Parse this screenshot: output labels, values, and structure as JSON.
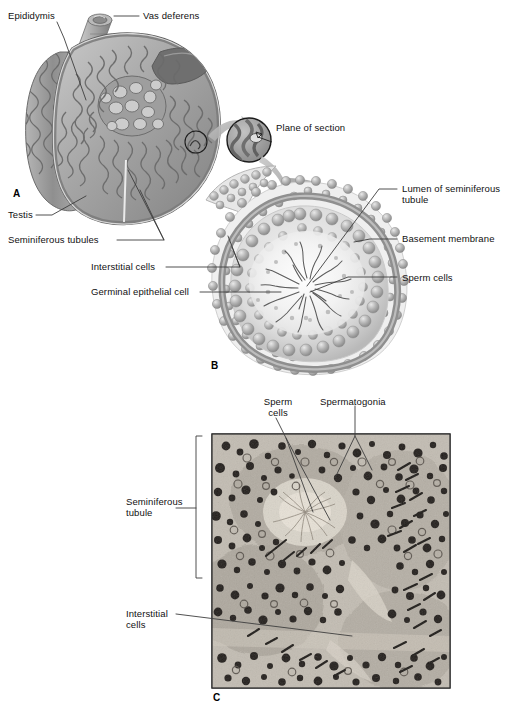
{
  "figure": {
    "type": "anatomy-illustration-plate",
    "panels": [
      "A",
      "B",
      "C"
    ]
  },
  "panel_a": {
    "letter": "A",
    "caption_type": "sagittal-section-illustration-of-testis-and-epididymis",
    "labels": [
      {
        "id": "epididymis",
        "text": "Epididymis"
      },
      {
        "id": "vas-deferens",
        "text": "Vas deferens"
      },
      {
        "id": "testis",
        "text": "Testis"
      },
      {
        "id": "seminiferous-tubules",
        "text": "Seminiferous tubules"
      }
    ]
  },
  "panel_inset": {
    "label": "Plane of section"
  },
  "panel_b": {
    "letter": "B",
    "caption_type": "cross-section-illustration-of-seminiferous-tubule",
    "labels": [
      {
        "id": "lumen-of-seminiferous-tubule",
        "text": "Lumen of seminiferous\ntubule",
        "line1": "Lumen of seminiferous",
        "line2": "tubule"
      },
      {
        "id": "basement-membrane",
        "text": "Basement membrane"
      },
      {
        "id": "sperm-cells",
        "text": "Sperm cells"
      },
      {
        "id": "interstitial-cells",
        "text": "Interstitial cells"
      },
      {
        "id": "germinal-epithelial-cell",
        "text": "Germinal epithelial cell"
      }
    ]
  },
  "panel_c": {
    "letter": "C",
    "caption_type": "light-micrograph-of-seminiferous-tubules",
    "labels": [
      {
        "id": "sperm-cells",
        "line1": "Sperm",
        "line2": "cells"
      },
      {
        "id": "spermatogonia",
        "line1": "Spermatogonia",
        "line2": ""
      },
      {
        "id": "seminiferous-tubule",
        "line1": "Seminiferous",
        "line2": "tubule"
      },
      {
        "id": "interstitial-cells",
        "line1": "Interstitial",
        "line2": "cells"
      }
    ]
  },
  "colors": {
    "label_text": "#111111",
    "leader_line": "#4a4a4a",
    "tissue_mid": "#9a9a9a",
    "tissue_dark": "#6e6e6e",
    "tissue_light": "#d8d8d8",
    "background": "#ffffff",
    "micrograph_base": "#b8b2a8"
  }
}
